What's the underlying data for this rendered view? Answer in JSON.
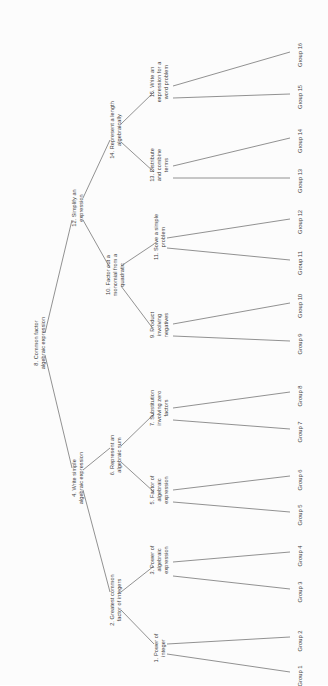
{
  "diagram": {
    "type": "binary-tree",
    "orientation": "rotated-90-ccw",
    "root_id": "n8",
    "nodes": [
      {
        "id": "n8",
        "label": "8. Common factor\nalgebraic expression",
        "x": 40,
        "y": 343,
        "depth": 0
      },
      {
        "id": "n4",
        "label": "4. Write simple\nalgebraic expression",
        "x": 78,
        "y": 478,
        "depth": 1
      },
      {
        "id": "n12",
        "label": "12. Simplify an\nexpression",
        "x": 78,
        "y": 208,
        "depth": 1
      },
      {
        "id": "n2",
        "label": "2. Greatest common\nfactor of integers",
        "x": 116,
        "y": 600,
        "depth": 2
      },
      {
        "id": "n6",
        "label": "6. Represent an\nalgebraic sum",
        "x": 116,
        "y": 455,
        "depth": 2
      },
      {
        "id": "n10",
        "label": "10. Factor out a\nmonomial from a\nquadratic",
        "x": 116,
        "y": 275,
        "depth": 2
      },
      {
        "id": "n14",
        "label": "14. Represent a length\nalgebraically",
        "x": 116,
        "y": 130,
        "depth": 2
      },
      {
        "id": "n1",
        "label": "1. Power of\ninteger",
        "x": 160,
        "y": 648,
        "depth": 3
      },
      {
        "id": "n3",
        "label": "3. Power of\nalgebraic\nexpression",
        "x": 160,
        "y": 560,
        "depth": 3
      },
      {
        "id": "n5",
        "label": "5. Factor of\nalgebraic\nexpression",
        "x": 160,
        "y": 490,
        "depth": 3
      },
      {
        "id": "n7",
        "label": "7. Substitution\ninvolving zero\nfactors",
        "x": 160,
        "y": 408,
        "depth": 3
      },
      {
        "id": "n9",
        "label": "9. Product\ninvolving\nnegatives",
        "x": 160,
        "y": 325,
        "depth": 3
      },
      {
        "id": "n11",
        "label": "11. Solve a simple\nproblem",
        "x": 160,
        "y": 237,
        "depth": 3
      },
      {
        "id": "n13",
        "label": "13. Distribute\nand combine\nterms",
        "x": 160,
        "y": 165,
        "depth": 3
      },
      {
        "id": "n15",
        "label": "15. Write an\nexpression for a\nword problem",
        "x": 160,
        "y": 82,
        "depth": 3
      }
    ],
    "leaves": [
      {
        "id": "g1",
        "label": "Group 1",
        "x": 300,
        "y": 676
      },
      {
        "id": "g2",
        "label": "Group 2",
        "x": 300,
        "y": 641
      },
      {
        "id": "g3",
        "label": "Group 3",
        "x": 300,
        "y": 592
      },
      {
        "id": "g4",
        "label": "Group 4",
        "x": 300,
        "y": 556
      },
      {
        "id": "g5",
        "label": "Group 5",
        "x": 300,
        "y": 515
      },
      {
        "id": "g6",
        "label": "Group 6",
        "x": 300,
        "y": 480
      },
      {
        "id": "g7",
        "label": "Group 7",
        "x": 300,
        "y": 432
      },
      {
        "id": "g8",
        "label": "Group 8",
        "x": 300,
        "y": 396
      },
      {
        "id": "g9",
        "label": "Group 9",
        "x": 300,
        "y": 344
      },
      {
        "id": "g10",
        "label": "Group 10",
        "x": 300,
        "y": 306
      },
      {
        "id": "g11",
        "label": "Group 11",
        "x": 300,
        "y": 263
      },
      {
        "id": "g12",
        "label": "Group 12",
        "x": 300,
        "y": 222
      },
      {
        "id": "g13",
        "label": "Group 13",
        "x": 300,
        "y": 181
      },
      {
        "id": "g14",
        "label": "Group 14",
        "x": 300,
        "y": 141
      },
      {
        "id": "g15",
        "label": "Group 15",
        "x": 300,
        "y": 97
      },
      {
        "id": "g16",
        "label": "Group 16",
        "x": 300,
        "y": 55
      }
    ],
    "edges": [
      {
        "from": "n8",
        "to": "n4",
        "x1": 45,
        "y1": 355,
        "x2": 72,
        "y2": 468
      },
      {
        "from": "n8",
        "to": "n12",
        "x1": 45,
        "y1": 333,
        "x2": 72,
        "y2": 220
      },
      {
        "from": "n4",
        "to": "n2",
        "x1": 83,
        "y1": 490,
        "x2": 110,
        "y2": 592
      },
      {
        "from": "n4",
        "to": "n6",
        "x1": 83,
        "y1": 470,
        "x2": 110,
        "y2": 448
      },
      {
        "from": "n12",
        "to": "n10",
        "x1": 83,
        "y1": 220,
        "x2": 110,
        "y2": 268
      },
      {
        "from": "n12",
        "to": "n14",
        "x1": 83,
        "y1": 198,
        "x2": 110,
        "y2": 140
      },
      {
        "from": "n2",
        "to": "n1",
        "x1": 121,
        "y1": 610,
        "x2": 154,
        "y2": 644
      },
      {
        "from": "n2",
        "to": "n3",
        "x1": 121,
        "y1": 592,
        "x2": 154,
        "y2": 566
      },
      {
        "from": "n6",
        "to": "n5",
        "x1": 121,
        "y1": 462,
        "x2": 154,
        "y2": 492
      },
      {
        "from": "n6",
        "to": "n7",
        "x1": 121,
        "y1": 446,
        "x2": 154,
        "y2": 414
      },
      {
        "from": "n10",
        "to": "n9",
        "x1": 121,
        "y1": 286,
        "x2": 154,
        "y2": 330
      },
      {
        "from": "n10",
        "to": "n11",
        "x1": 121,
        "y1": 266,
        "x2": 154,
        "y2": 244
      },
      {
        "from": "n14",
        "to": "n13",
        "x1": 121,
        "y1": 142,
        "x2": 154,
        "y2": 172
      },
      {
        "from": "n14",
        "to": "n15",
        "x1": 121,
        "y1": 124,
        "x2": 154,
        "y2": 92
      },
      {
        "from": "n1",
        "to": "g1",
        "x1": 167,
        "y1": 654,
        "x2": 290,
        "y2": 672
      },
      {
        "from": "n1",
        "to": "g2",
        "x1": 167,
        "y1": 644,
        "x2": 290,
        "y2": 637
      },
      {
        "from": "n3",
        "to": "g3",
        "x1": 173,
        "y1": 576,
        "x2": 290,
        "y2": 589
      },
      {
        "from": "n3",
        "to": "g4",
        "x1": 173,
        "y1": 562,
        "x2": 290,
        "y2": 552
      },
      {
        "from": "n5",
        "to": "g5",
        "x1": 173,
        "y1": 502,
        "x2": 290,
        "y2": 512
      },
      {
        "from": "n5",
        "to": "g6",
        "x1": 173,
        "y1": 490,
        "x2": 290,
        "y2": 476
      },
      {
        "from": "n7",
        "to": "g7",
        "x1": 173,
        "y1": 420,
        "x2": 290,
        "y2": 429
      },
      {
        "from": "n7",
        "to": "g8",
        "x1": 173,
        "y1": 408,
        "x2": 290,
        "y2": 392
      },
      {
        "from": "n9",
        "to": "g9",
        "x1": 173,
        "y1": 336,
        "x2": 290,
        "y2": 341
      },
      {
        "from": "n9",
        "to": "g10",
        "x1": 173,
        "y1": 324,
        "x2": 290,
        "y2": 303
      },
      {
        "from": "n11",
        "to": "g11",
        "x1": 167,
        "y1": 248,
        "x2": 290,
        "y2": 260
      },
      {
        "from": "n11",
        "to": "g12",
        "x1": 167,
        "y1": 238,
        "x2": 290,
        "y2": 219
      },
      {
        "from": "n13",
        "to": "g13",
        "x1": 173,
        "y1": 178,
        "x2": 290,
        "y2": 178
      },
      {
        "from": "n13",
        "to": "g14",
        "x1": 173,
        "y1": 166,
        "x2": 290,
        "y2": 138
      },
      {
        "from": "n15",
        "to": "g15",
        "x1": 173,
        "y1": 98,
        "x2": 290,
        "y2": 94
      },
      {
        "from": "n15",
        "to": "g16",
        "x1": 173,
        "y1": 86,
        "x2": 290,
        "y2": 52
      }
    ],
    "colors": {
      "background": "#fcfcfc",
      "edge": "#6e6e6e",
      "text": "#3d3d3d"
    }
  }
}
